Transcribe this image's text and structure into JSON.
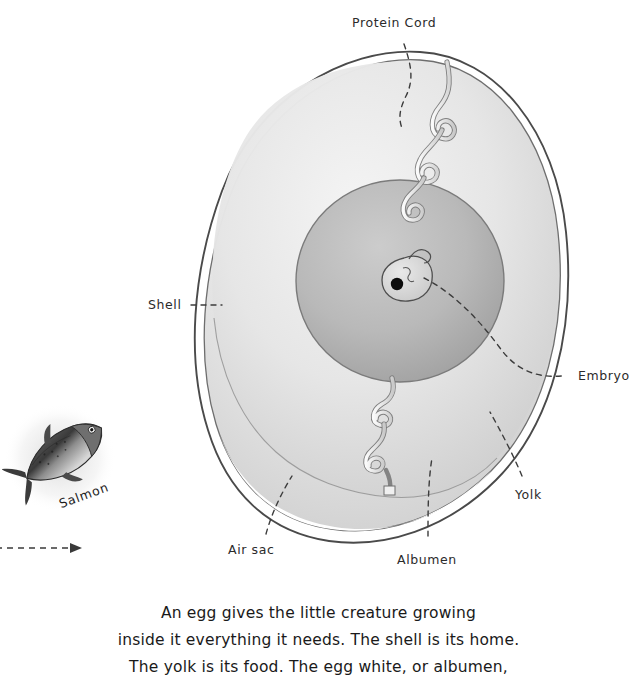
{
  "diagram": {
    "title_subject": "egg anatomy",
    "labels": [
      {
        "id": "protein-cord",
        "text": "Protein Cord"
      },
      {
        "id": "shell",
        "text": "Shell"
      },
      {
        "id": "embryo",
        "text": "Embryo"
      },
      {
        "id": "yolk",
        "text": "Yolk"
      },
      {
        "id": "air-sac",
        "text": "Air sac"
      },
      {
        "id": "albumen",
        "text": "Albumen"
      }
    ],
    "colors": {
      "ink": "#3a3a3a",
      "albumen_fill": "#e8e8e8",
      "yolk_fill": "#b8b8b8",
      "embryo_fill": "#d8d8d8",
      "eye": "#0d0d0d",
      "cord_fill": "#eeeeee",
      "background": "#ffffff"
    }
  },
  "salmon": {
    "caption": "Salmon"
  },
  "body_text": {
    "line1": "An egg gives the little creature growing",
    "line2": "inside it everything it needs. The shell is its home.",
    "line3": "The yolk is its food. The egg white, or albumen,"
  }
}
